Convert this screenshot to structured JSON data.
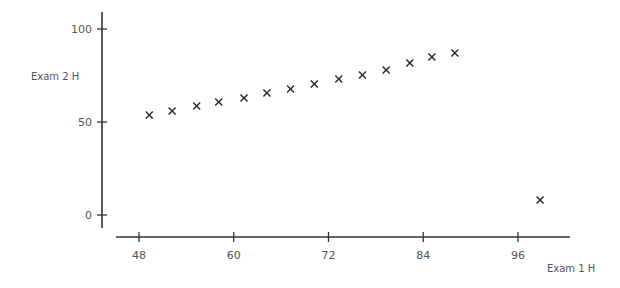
{
  "chart_data": {
    "type": "scatter",
    "title": "",
    "xlabel": "Exam 1 H",
    "ylabel": "Exam 2 H",
    "xlim": [
      45,
      103
    ],
    "ylim": [
      -7,
      108
    ],
    "x_ticks": [
      48,
      60,
      72,
      84,
      96
    ],
    "y_ticks": [
      0,
      50,
      100
    ],
    "grid": false,
    "legend": null,
    "marker": "x",
    "series": [
      {
        "name": "Exam scores",
        "points": [
          {
            "x": 49.3,
            "y": 53.8
          },
          {
            "x": 52.2,
            "y": 55.9
          },
          {
            "x": 55.3,
            "y": 58.6
          },
          {
            "x": 58.1,
            "y": 60.8
          },
          {
            "x": 61.3,
            "y": 62.9
          },
          {
            "x": 64.2,
            "y": 65.6
          },
          {
            "x": 67.2,
            "y": 67.7
          },
          {
            "x": 70.2,
            "y": 70.4
          },
          {
            "x": 73.3,
            "y": 73.1
          },
          {
            "x": 76.3,
            "y": 75.3
          },
          {
            "x": 79.3,
            "y": 78.0
          },
          {
            "x": 82.3,
            "y": 81.7
          },
          {
            "x": 85.1,
            "y": 84.9
          },
          {
            "x": 88.0,
            "y": 87.1
          },
          {
            "x": 98.8,
            "y": 8.1
          }
        ]
      }
    ],
    "colors": {
      "marker": "#2b2b3a",
      "axis": "#333333",
      "text": "#555555"
    }
  },
  "labels": {
    "x_axis_title": "Exam 1 H",
    "y_axis_title": "Exam 2 H"
  }
}
